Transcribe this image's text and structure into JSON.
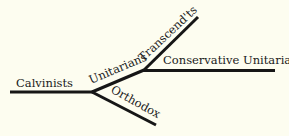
{
  "diagram": {
    "type": "tree",
    "background": "#fdfdf0",
    "line_color": "#161616",
    "nodes": [
      {
        "id": "calvinists",
        "label": "Calvinists"
      },
      {
        "id": "unitarians",
        "label": "Unitarians"
      },
      {
        "id": "orthodox",
        "label": "Orthodox"
      },
      {
        "id": "transcendentalists",
        "label": "Transcend'ts"
      },
      {
        "id": "conservative_unitarians",
        "label": "Conservative Unitarians"
      }
    ],
    "edges": [
      {
        "from": "calvinists",
        "to": "unitarians"
      },
      {
        "from": "calvinists",
        "to": "orthodox"
      },
      {
        "from": "unitarians",
        "to": "transcendentalists"
      },
      {
        "from": "unitarians",
        "to": "conservative_unitarians"
      }
    ]
  }
}
